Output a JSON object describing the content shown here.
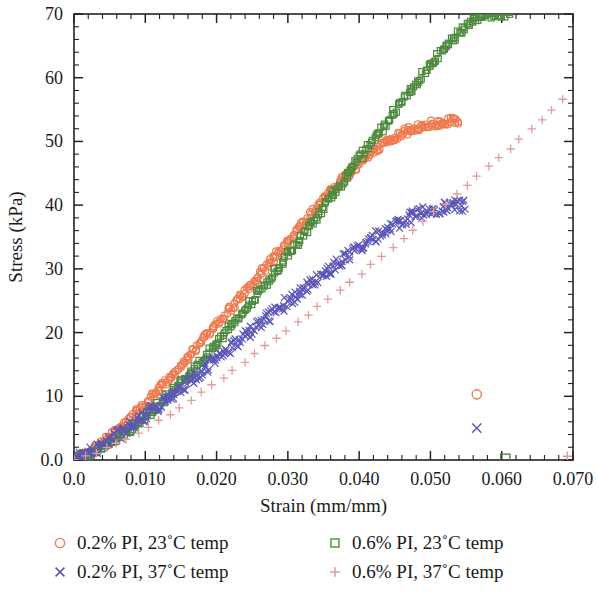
{
  "chart_data": {
    "type": "scatter",
    "title": "",
    "xlabel": "Strain (mm/mm)",
    "ylabel": "Stress (kPa)",
    "xlim": [
      0.0,
      0.07
    ],
    "ylim": [
      0.0,
      70
    ],
    "xticks": [
      "0.0",
      "0.010",
      "0.020",
      "0.030",
      "0.040",
      "0.050",
      "0.060",
      "0.070"
    ],
    "xtick_values": [
      0.0,
      0.01,
      0.02,
      0.03,
      0.04,
      0.05,
      0.06,
      0.07
    ],
    "yticks": [
      "0.0",
      "10",
      "20",
      "30",
      "40",
      "50",
      "60",
      "70"
    ],
    "ytick_values": [
      0,
      10,
      20,
      30,
      40,
      50,
      60,
      70
    ],
    "x_minor_interval": 0.002,
    "y_minor_interval": 2,
    "grid": false,
    "legend_position": "below-plot",
    "series": [
      {
        "name": "0.2% PI, 23˚C temp",
        "marker": "circle",
        "color": "#F0794E",
        "x": [
          0.0,
          0.002,
          0.004,
          0.006,
          0.008,
          0.01,
          0.012,
          0.014,
          0.016,
          0.018,
          0.02,
          0.022,
          0.024,
          0.026,
          0.028,
          0.03,
          0.032,
          0.034,
          0.036,
          0.038,
          0.04,
          0.042,
          0.044,
          0.046,
          0.048,
          0.05,
          0.052,
          0.0535,
          0.054
        ],
        "y": [
          0.0,
          1.2,
          2.8,
          4.6,
          6.6,
          8.8,
          11.2,
          13.6,
          16.1,
          18.6,
          21.2,
          23.8,
          26.4,
          29.0,
          31.7,
          34.3,
          37.0,
          39.6,
          42.1,
          44.4,
          46.5,
          48.4,
          50.0,
          51.3,
          52.2,
          52.8,
          53.1,
          53.2,
          52.9
        ],
        "outliers": [
          {
            "x": 0.0565,
            "y": 10.3
          }
        ]
      },
      {
        "name": "0.6% PI, 23˚C temp",
        "marker": "square",
        "color": "#4C8A3E",
        "x": [
          0.0,
          0.002,
          0.004,
          0.006,
          0.008,
          0.01,
          0.012,
          0.014,
          0.016,
          0.018,
          0.02,
          0.022,
          0.024,
          0.026,
          0.028,
          0.03,
          0.032,
          0.034,
          0.036,
          0.038,
          0.04,
          0.042,
          0.044,
          0.046,
          0.048,
          0.05,
          0.052,
          0.054,
          0.056,
          0.058,
          0.06,
          0.0612
        ],
        "y": [
          0.0,
          0.9,
          2.0,
          3.4,
          5.0,
          6.8,
          8.8,
          11.0,
          13.3,
          15.7,
          18.3,
          20.9,
          23.6,
          26.4,
          29.3,
          32.2,
          35.2,
          38.2,
          41.2,
          44.2,
          47.2,
          50.2,
          53.2,
          56.2,
          59.1,
          61.9,
          64.6,
          67.1,
          69.1,
          69.9,
          70.0,
          70.0
        ],
        "outliers": [
          {
            "x": 0.0605,
            "y": 0.2
          }
        ]
      },
      {
        "name": "0.2% PI, 37˚C temp",
        "marker": "x",
        "color": "#5B56B8",
        "x": [
          0.0,
          0.002,
          0.004,
          0.006,
          0.008,
          0.01,
          0.012,
          0.014,
          0.016,
          0.018,
          0.02,
          0.022,
          0.024,
          0.026,
          0.028,
          0.03,
          0.032,
          0.034,
          0.036,
          0.038,
          0.04,
          0.042,
          0.044,
          0.046,
          0.048,
          0.05,
          0.052,
          0.054,
          0.055
        ],
        "y": [
          0.0,
          1.0,
          2.3,
          3.7,
          5.3,
          7.0,
          8.7,
          10.5,
          12.3,
          14.1,
          15.9,
          17.7,
          19.5,
          21.3,
          23.1,
          24.9,
          26.6,
          28.3,
          30.0,
          31.7,
          33.3,
          34.9,
          36.3,
          37.5,
          38.5,
          39.3,
          39.7,
          39.9,
          40.0
        ],
        "outliers": [
          {
            "x": 0.0565,
            "y": 5.0
          }
        ]
      },
      {
        "name": "0.6% PI, 37˚C temp",
        "marker": "plus",
        "color": "#E59A9A",
        "x": [
          0.0,
          0.003,
          0.006,
          0.009,
          0.012,
          0.015,
          0.018,
          0.021,
          0.024,
          0.027,
          0.03,
          0.033,
          0.036,
          0.039,
          0.042,
          0.045,
          0.048,
          0.051,
          0.054,
          0.057,
          0.06,
          0.063,
          0.066,
          0.0685
        ],
        "y": [
          0.0,
          1.1,
          2.5,
          4.2,
          6.2,
          8.4,
          10.7,
          13.1,
          15.5,
          18.0,
          20.5,
          23.0,
          25.6,
          28.2,
          30.9,
          33.6,
          36.4,
          39.2,
          42.1,
          45.0,
          47.9,
          50.9,
          53.9,
          56.6
        ],
        "outliers": [
          {
            "x": 0.0692,
            "y": 0.6
          }
        ]
      }
    ]
  },
  "legend": {
    "entries": [
      {
        "label": "0.2% PI, 23˚C temp",
        "marker": "circle",
        "color": "#F0794E"
      },
      {
        "label": "0.6% PI, 23˚C temp",
        "marker": "square",
        "color": "#4C8A3E"
      },
      {
        "label": "0.2% PI, 37˚C temp",
        "marker": "x",
        "color": "#5B56B8"
      },
      {
        "label": "0.6% PI, 37˚C temp",
        "marker": "plus",
        "color": "#E59A9A"
      }
    ]
  }
}
